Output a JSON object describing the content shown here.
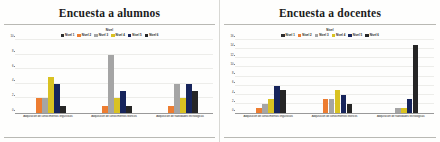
{
  "page": {
    "background": "#fdfdfb"
  },
  "colors": {
    "nivel_1": "#2f2f2f",
    "nivel_2": "#ed7d31",
    "nivel_3": "#a5a5a5",
    "nivel_4": "#d9c222",
    "nivel_5": "#17255c",
    "nivel_6": "#262626",
    "axis": "#9a9a9a",
    "gridline": "#ededea",
    "title_text": "#1b1b1b"
  },
  "charts": [
    {
      "id": "encuesta-alumnos",
      "title": "Encuesta a alumnos",
      "chart_data": {
        "type": "bar",
        "title": "Encuesta a alumnos",
        "xlabel": "",
        "ylabel": "",
        "ylim": [
          0,
          10
        ],
        "yticks": [
          "0",
          "2",
          "4",
          "6",
          "8",
          "10"
        ],
        "grid": true,
        "legend_position": "top",
        "legend_title": "Nivel",
        "categories": [
          "Adquisición de conocimientos lingüísticos",
          "Adquisición de conocimientos teóricos",
          "Adquisición de habilidades tecnológicas"
        ],
        "series": [
          {
            "name": "Nivel 1",
            "color": "#2f2f2f",
            "values": [
              0,
              0,
              0
            ]
          },
          {
            "name": "Nivel 2",
            "color": "#ed7d31",
            "values": [
              2,
              1,
              1
            ]
          },
          {
            "name": "Nivel 3",
            "color": "#a5a5a5",
            "values": [
              2,
              8,
              4
            ]
          },
          {
            "name": "Nivel 4",
            "color": "#d9c222",
            "values": [
              5,
              2,
              2
            ]
          },
          {
            "name": "Nivel 5",
            "color": "#17255c",
            "values": [
              4,
              3,
              4
            ]
          },
          {
            "name": "Nivel 6",
            "color": "#262626",
            "values": [
              1,
              1,
              3
            ]
          }
        ]
      }
    },
    {
      "id": "encuesta-docentes",
      "title": "Encuesta a docentes",
      "chart_data": {
        "type": "bar",
        "title": "Encuesta a docentes",
        "xlabel": "",
        "ylabel": "",
        "ylim": [
          0,
          16
        ],
        "yticks": [
          "0",
          "2",
          "4",
          "6",
          "8",
          "10",
          "12",
          "14",
          "16"
        ],
        "grid": true,
        "legend_position": "top",
        "legend_title": "Nivel",
        "categories": [
          "Adquisición de conocimientos lingüísticos",
          "Adquisición de conocimientos teóricos",
          "Adquisición de habilidades tecnológicas"
        ],
        "series": [
          {
            "name": "Nivel 1",
            "color": "#2f2f2f",
            "values": [
              0,
              0,
              0
            ]
          },
          {
            "name": "Nivel 2",
            "color": "#ed7d31",
            "values": [
              1,
              3,
              0
            ]
          },
          {
            "name": "Nivel 3",
            "color": "#a5a5a5",
            "values": [
              2,
              3,
              1
            ]
          },
          {
            "name": "Nivel 4",
            "color": "#d9c222",
            "values": [
              3,
              5,
              1
            ]
          },
          {
            "name": "Nivel 5",
            "color": "#17255c",
            "values": [
              6,
              4,
              3
            ]
          },
          {
            "name": "Nivel 6",
            "color": "#262626",
            "values": [
              5,
              2,
              15
            ]
          }
        ]
      }
    }
  ]
}
